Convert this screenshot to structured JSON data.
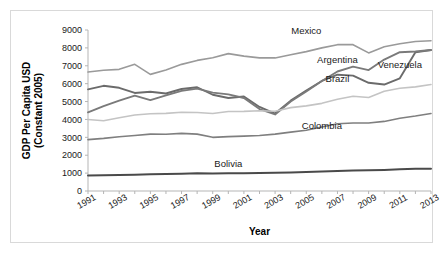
{
  "chart_data": {
    "type": "line",
    "title": "",
    "xlabel": "Year",
    "ylabel": "GDP Per Capita USD (Constant 2005)",
    "ylabel_line1": "GDP Per Capita USD",
    "ylabel_line2": "(Constant 2005)",
    "ylim": [
      0,
      9000
    ],
    "xlim": [
      1991,
      2013
    ],
    "grid": false,
    "legend_position": "inline-labels",
    "ytick_labels": [
      "9000",
      "8000",
      "7000",
      "6000",
      "5000",
      "4000",
      "3000",
      "2000",
      "1000",
      "0"
    ],
    "ytick_values": [
      9000,
      8000,
      7000,
      6000,
      5000,
      4000,
      3000,
      2000,
      1000,
      0
    ],
    "xtick_labels": [
      "1991",
      "1993",
      "1995",
      "1997",
      "1999",
      "2001",
      "2003",
      "2005",
      "2007",
      "2009",
      "2011",
      "2013"
    ],
    "xtick_values": [
      1991,
      1993,
      1995,
      1997,
      1999,
      2001,
      2003,
      2005,
      2007,
      2009,
      2011,
      2013
    ],
    "x": [
      1991,
      1992,
      1993,
      1994,
      1995,
      1996,
      1997,
      1998,
      1999,
      2000,
      2001,
      2002,
      2003,
      2004,
      2005,
      2006,
      2007,
      2008,
      2009,
      2010,
      2011,
      2012,
      2013
    ],
    "series": [
      {
        "name": "Mexico",
        "color": "#9a9a9a",
        "width": 1.6,
        "label_x": 2005,
        "label_y": 8750,
        "values": [
          6650,
          6750,
          6800,
          7080,
          6520,
          6760,
          7080,
          7300,
          7450,
          7680,
          7540,
          7440,
          7440,
          7620,
          7790,
          8000,
          8180,
          8180,
          7720,
          8060,
          8230,
          8360,
          8400
        ]
      },
      {
        "name": "Venezuela",
        "color": "#6b6b6b",
        "width": 1.9,
        "label_x": 2011,
        "label_y": 6900,
        "values": [
          5680,
          5880,
          5770,
          5480,
          5550,
          5450,
          5700,
          5800,
          5380,
          5200,
          5280,
          4700,
          4330,
          5050,
          5620,
          6150,
          6500,
          6450,
          6050,
          5950,
          6300,
          7750,
          7880
        ]
      },
      {
        "name": "Argentina",
        "color": "#7a7a7a",
        "width": 1.9,
        "label_x": 2007,
        "label_y": 7150,
        "values": [
          4400,
          4750,
          5050,
          5330,
          5080,
          5350,
          5600,
          5720,
          5500,
          5400,
          5200,
          4580,
          4280,
          5000,
          5560,
          6150,
          6680,
          6950,
          6760,
          7350,
          7760,
          7800,
          7880
        ]
      },
      {
        "name": "Brazil",
        "color": "#c4c4c4",
        "width": 1.6,
        "label_x": 2007,
        "label_y": 6100,
        "values": [
          4000,
          3930,
          4090,
          4250,
          4320,
          4340,
          4400,
          4390,
          4330,
          4440,
          4450,
          4490,
          4460,
          4660,
          4760,
          4900,
          5130,
          5300,
          5230,
          5580,
          5740,
          5820,
          5950
        ]
      },
      {
        "name": "Colombia",
        "color": "#7f7f7f",
        "width": 1.6,
        "label_x": 2006,
        "label_y": 3450,
        "values": [
          2870,
          2940,
          3030,
          3100,
          3180,
          3170,
          3220,
          3180,
          3000,
          3040,
          3070,
          3100,
          3180,
          3290,
          3400,
          3580,
          3760,
          3800,
          3800,
          3890,
          4070,
          4190,
          4330
        ]
      },
      {
        "name": "Bolivia",
        "color": "#4a4a4a",
        "width": 2.0,
        "label_x": 2000,
        "label_y": 1350,
        "values": [
          870,
          880,
          890,
          910,
          930,
          950,
          970,
          990,
          980,
          990,
          990,
          1000,
          1020,
          1040,
          1060,
          1090,
          1120,
          1150,
          1160,
          1180,
          1210,
          1240,
          1250
        ]
      }
    ]
  }
}
